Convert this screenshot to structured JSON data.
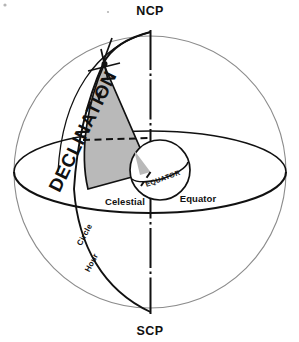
{
  "diagram": {
    "title": "Celestial sphere showing declination and hour circle",
    "labels": {
      "ncp": "NCP",
      "scp": "SCP",
      "celestial": "Celestial",
      "equator": "Equator",
      "inner_equator": "EQUATOR",
      "hour": "Hour",
      "circle": "Circle",
      "declination": "DECLINATION"
    },
    "colors": {
      "ink": "#111111",
      "sphere_outline": "#8c8c8c",
      "wedge_fill": "#b9b9b9",
      "background": "#ffffff"
    },
    "elements": {
      "outer_sphere": "celestial sphere",
      "polar_axis": "axis of rotation NCP to SCP",
      "celestial_equator": "celestial equator ellipse",
      "hour_circle": "hour circle meridian through star",
      "declination_wedge": "shaded declination angle wedge",
      "inner_earth": "Earth at center",
      "star_marker": "star position marker"
    }
  }
}
